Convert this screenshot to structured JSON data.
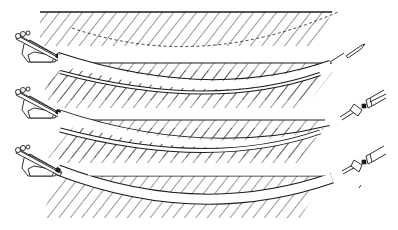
{
  "diagram": {
    "title": "",
    "colors": {
      "ink": "#1a1a1a",
      "background": "#ffffff"
    },
    "stages": [
      {
        "id": "pilot-bore",
        "ground_top_y": 12,
        "ground_bottom_y": 63,
        "surface_x": [
          40,
          332
        ],
        "bore_path": "M60 56 Q210 98 330 63",
        "bore_width": 3,
        "planned_path": "M70 28 Q200 70 338 12",
        "tool": "drill-bit"
      },
      {
        "id": "reaming",
        "ground_top_y": 120,
        "surface_x": [
          75,
          325
        ],
        "bore_path": "M60 113 Q210 158 330 122",
        "bore_width": 5,
        "tool": "reamer"
      },
      {
        "id": "pullback",
        "ground_top_y": 175,
        "surface_x": [
          85,
          325
        ],
        "bore_path": "M60 168 Q210 218 330 178",
        "bore_width": 9,
        "tool": "reamer-with-pipe"
      }
    ]
  }
}
